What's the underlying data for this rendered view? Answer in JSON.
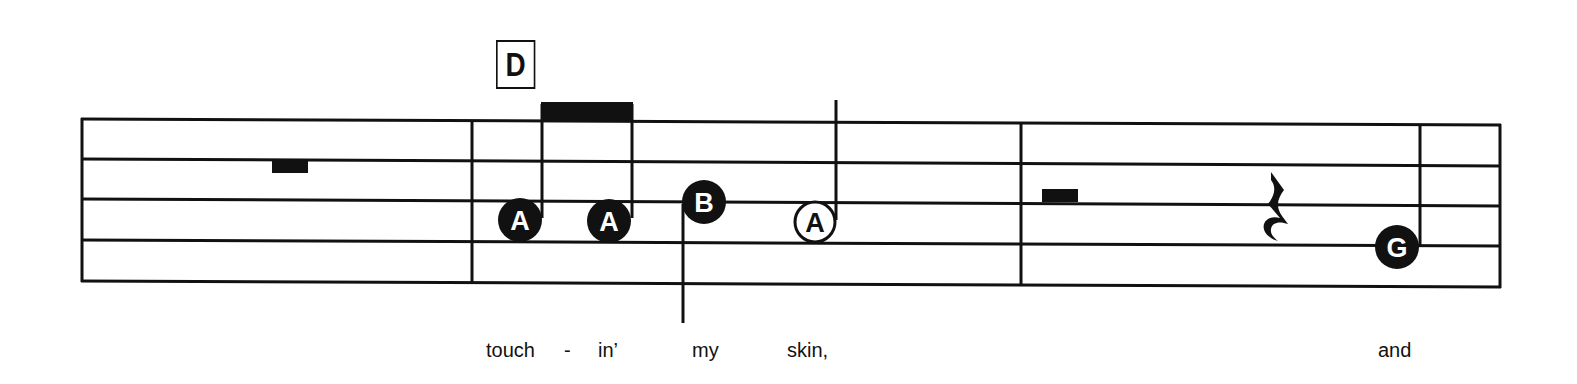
{
  "rehearsal_mark": {
    "label": "D"
  },
  "staff": {
    "line_count": 5,
    "color": "#111111",
    "measures": 3
  },
  "notes": [
    {
      "measure": 2,
      "name": "A",
      "type": "eighth",
      "style": "filled",
      "beamed": true
    },
    {
      "measure": 2,
      "name": "A",
      "type": "eighth",
      "style": "filled",
      "beamed": true
    },
    {
      "measure": 2,
      "name": "B",
      "type": "quarter",
      "style": "filled",
      "stem": "down"
    },
    {
      "measure": 2,
      "name": "A",
      "type": "half",
      "style": "open",
      "stem": "up"
    },
    {
      "measure": 3,
      "name": "G",
      "type": "quarter",
      "style": "filled",
      "stem": "up"
    }
  ],
  "rests": [
    {
      "measure": 1,
      "type": "whole"
    },
    {
      "measure": 3,
      "type": "half"
    },
    {
      "measure": 3,
      "type": "quarter"
    }
  ],
  "lyrics": [
    {
      "text": "touch"
    },
    {
      "text": "-"
    },
    {
      "text": "in’"
    },
    {
      "text": "my"
    },
    {
      "text": "skin,"
    },
    {
      "text": "and"
    }
  ]
}
